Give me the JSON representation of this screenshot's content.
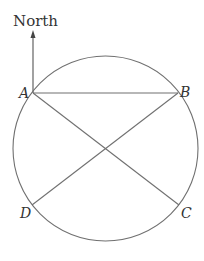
{
  "diagram": {
    "direction_label": "North",
    "points": {
      "A": {
        "label": "A",
        "x": 33,
        "y": 93
      },
      "B": {
        "label": "B",
        "x": 178,
        "y": 93
      },
      "C": {
        "label": "C",
        "x": 179,
        "y": 205
      },
      "D": {
        "label": "D",
        "x": 32,
        "y": 205
      }
    },
    "circle": {
      "cx": 105.5,
      "cy": 148.5,
      "r": 92.5
    },
    "segments": [
      "AB",
      "AC",
      "BD"
    ],
    "arrow": {
      "from": "A",
      "direction": "north"
    },
    "colors": {
      "line": "#707070",
      "text": "#333333",
      "background": "#ffffff"
    }
  }
}
